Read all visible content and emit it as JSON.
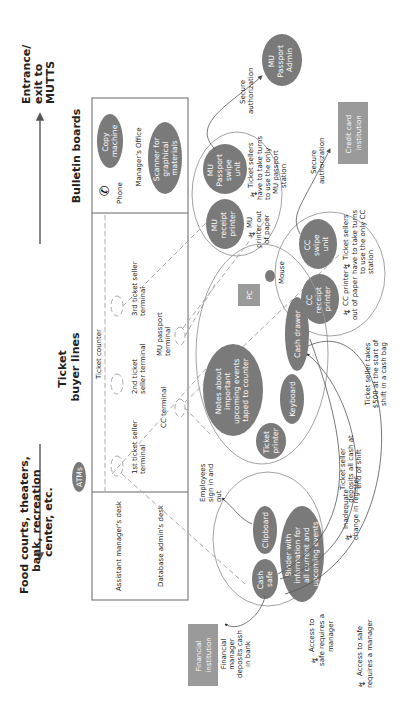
{
  "directions": {
    "left": {
      "label_lines": [
        "Food courts, theaters,",
        "bank, recreation",
        "center, etc."
      ]
    },
    "right": {
      "label_lines": [
        "Entrance/",
        "exit to",
        "MUTTS"
      ]
    }
  },
  "zones": {
    "ticket_buyer_lines": {
      "label_lines": [
        "Ticket",
        "buyer lines"
      ]
    },
    "bulletin_boards": {
      "label": "Bulletin boards"
    },
    "ticket_counter": {
      "label": "Ticket counter"
    },
    "managers_office": {
      "label": "Manager's Office"
    },
    "assistant_managers_desk": {
      "label": "Assistant manager's desk"
    },
    "database_admins_desk": {
      "label": "Database admin's desk"
    }
  },
  "terminals": [
    {
      "label_lines": [
        "1st ticket seller",
        "terminal"
      ]
    },
    {
      "label_lines": [
        "2nd ticket",
        "seller terminal"
      ]
    },
    {
      "label_lines": [
        "3rd ticket seller",
        "terminal"
      ]
    },
    {
      "label_lines": [
        "CC terminal"
      ]
    },
    {
      "label_lines": [
        "MU passport",
        "terminal"
      ]
    }
  ],
  "equipment": {
    "atms": {
      "label": "ATMs"
    },
    "phone": {
      "label": "Phone",
      "icon": "phone-icon"
    },
    "copy_machine": {
      "label_lines": [
        "Copy",
        "machine"
      ]
    },
    "scanner": {
      "label_lines": [
        "Scanner for",
        "graphical",
        "materials"
      ]
    },
    "mu_receipt_printer": {
      "label_lines": [
        "MU",
        "receipt",
        "printer"
      ]
    },
    "mu_passport_swipe": {
      "label_lines": [
        "MU",
        "Passport",
        "swipe",
        "unit"
      ]
    },
    "mu_passport_admin": {
      "label_lines": [
        "MU",
        "Passport",
        "Admin"
      ]
    },
    "cc_receipt_printer": {
      "label_lines": [
        "CC",
        "receipt",
        "printer"
      ]
    },
    "cc_swipe_unit": {
      "label_lines": [
        "CC",
        "swipe",
        "unit"
      ]
    },
    "credit_card_institution": {
      "label_lines": [
        "Credit card",
        "institution"
      ]
    },
    "notes": {
      "label_lines": [
        "Notes about",
        "important",
        "upcoming events",
        "taped to counter"
      ]
    },
    "pc": {
      "label": "PC"
    },
    "mouse": {
      "label": "Mouse"
    },
    "keyboard": {
      "label": "Keyboard"
    },
    "ticket_printer": {
      "label_lines": [
        "Ticket",
        "printer"
      ]
    },
    "cash_drawer": {
      "label": "Cash drawer"
    },
    "cash_safe": {
      "label_lines": [
        "Cash",
        "safe"
      ]
    },
    "clipboard": {
      "label": "Clipboard"
    },
    "binder": {
      "label_lines": [
        "Binder with",
        "information for",
        "all current and",
        "upcoming events"
      ]
    },
    "financial_institution": {
      "label_lines": [
        "Financial",
        "institution"
      ]
    }
  },
  "annotations": {
    "mu_secure_auth": {
      "label_lines": [
        "Secure",
        "authorization"
      ]
    },
    "cc_secure_auth": {
      "label_lines": [
        "Secure",
        "authorization"
      ]
    },
    "mu_printer_out": {
      "label_lines": [
        "MU",
        "printer out",
        "of paper"
      ],
      "breakdown": true
    },
    "mu_turns": {
      "label_lines": [
        "Ticket sellers",
        "have to take turns",
        "to use the only",
        "MU passport",
        "station"
      ],
      "breakdown": true
    },
    "cc_printer_out": {
      "label_lines": [
        "CC printer",
        "out of paper"
      ],
      "breakdown": true
    },
    "cc_turns": {
      "label_lines": [
        "Ticket sellers",
        "have to take turns",
        "to use the only CC",
        "station"
      ],
      "breakdown": true
    },
    "employees_sign": {
      "label_lines": [
        "Employees",
        "sign in and",
        "out"
      ]
    },
    "deposits_all_cash": {
      "label_lines": [
        "Ticket seller",
        "deposits all cash at",
        "end of shift"
      ]
    },
    "takes_500": {
      "label_lines": [
        "Ticket seller takes",
        "$500 at the start of",
        "shift in a cash bag"
      ]
    },
    "inadequate_change": {
      "label_lines": [
        "Inadequate",
        "change in register"
      ],
      "breakdown": true
    },
    "financial_manager": {
      "label_lines": [
        "Financial",
        "manager",
        "deposits cash",
        "in bank"
      ]
    },
    "safe_access_1": {
      "label_lines": [
        "Access to",
        "safe requires a",
        "manager"
      ],
      "breakdown": true
    },
    "safe_access_2": {
      "label_lines": [
        "Access to safe",
        "requires a manager"
      ],
      "breakdown": true
    }
  },
  "colors": {
    "oval_fill": "#7a7a7a",
    "box_fill": "#9a9a9a",
    "wall": "#666666",
    "dashed": "#aaaaaa"
  }
}
